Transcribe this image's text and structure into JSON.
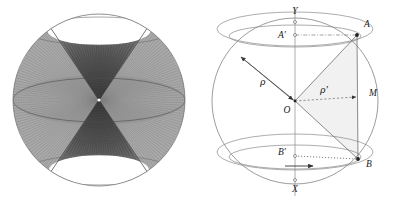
{
  "figure": {
    "panels": [
      {
        "id": "left-panel",
        "name": "sphere-double-cone-mesh",
        "description": "Shaded sphere with dense wireframe mesh forming two opposed cones meeting at the center",
        "geometry": {
          "sphere_center_x": 99,
          "sphere_center_y": 100,
          "sphere_radius": 86,
          "apex_x": 99,
          "apex_y": 100,
          "cone_half_angle_deg": 28,
          "equator_ry": 22,
          "top_cap_ry": 14,
          "bottom_cap_ry": 16
        },
        "colors": {
          "outline": "#7a7a7a",
          "mesh_dark": "#3a3a3a",
          "mesh_mid": "#8e8e8e",
          "mesh_light": "#bdbdbd",
          "cap_fill": "#ffffff"
        }
      },
      {
        "id": "right-panel",
        "name": "sphere-cross-section-rho-diagram",
        "description": "Great circle of a sphere with axis Y-X, points A, B on the surface, projections A-prime, B-prime, midpoint M, radius rho and sub-radius rho-prime",
        "geometry": {
          "circle_center_x": 96,
          "circle_center_y": 101,
          "circle_radius": 83,
          "axis_top_y": 8,
          "axis_bottom_y": 196,
          "point_O": [
            96,
            101
          ],
          "point_A": [
            158,
            35
          ],
          "point_B": [
            159,
            159
          ],
          "point_M": [
            157,
            97
          ],
          "point_A_prime": [
            96,
            35
          ],
          "point_B_prime": [
            96,
            156
          ],
          "point_Y": [
            96,
            22
          ],
          "point_X": [
            96,
            180
          ],
          "upper_ellipse_outer": {
            "cx": 96,
            "cy": 29,
            "rx": 78,
            "ry": 17
          },
          "upper_ellipse_inner": {
            "cx": 96,
            "cy": 36,
            "rx": 66,
            "ry": 11
          },
          "lower_ellipse_outer": {
            "cx": 96,
            "cy": 152,
            "rx": 78,
            "ry": 18
          },
          "lower_ellipse_inner": {
            "cx": 96,
            "cy": 157,
            "rx": 66,
            "ry": 12
          },
          "rho_arrow_end": [
            42,
            57
          ]
        },
        "colors": {
          "outline": "#8a8a8a",
          "construction": "#777777",
          "dashed": "#9a9a9a",
          "shade_fill": "#f0f0f0",
          "label": "#1a1a1a",
          "point": "#222222"
        },
        "labels": [
          {
            "key": "Y",
            "text": "Y",
            "x": 96,
            "y": 14,
            "anchor": "middle",
            "italic": true,
            "size": 9.5
          },
          {
            "key": "X",
            "text": "X",
            "x": 96,
            "y": 192,
            "anchor": "middle",
            "italic": true,
            "size": 9.5
          },
          {
            "key": "O",
            "text": "O",
            "x": 88,
            "y": 113,
            "anchor": "middle",
            "italic": true,
            "size": 9.5
          },
          {
            "key": "A",
            "text": "A",
            "x": 168,
            "y": 27,
            "anchor": "middle",
            "italic": true,
            "size": 9.5
          },
          {
            "key": "B",
            "text": "B",
            "x": 170,
            "y": 167,
            "anchor": "middle",
            "italic": true,
            "size": 9.5
          },
          {
            "key": "M",
            "text": "M",
            "x": 174,
            "y": 96,
            "anchor": "middle",
            "italic": true,
            "size": 9.5
          },
          {
            "key": "Aprime",
            "text": "A′",
            "x": 83,
            "y": 38,
            "anchor": "middle",
            "italic": true,
            "size": 9.5
          },
          {
            "key": "Bprime",
            "text": "B′",
            "x": 83,
            "y": 155,
            "anchor": "middle",
            "italic": true,
            "size": 9.5
          },
          {
            "key": "rho",
            "text": "ρ",
            "x": 64,
            "y": 85,
            "anchor": "middle",
            "italic": true,
            "size": 11
          },
          {
            "key": "rhoprime",
            "text": "ρ′",
            "x": 125,
            "y": 93,
            "anchor": "middle",
            "italic": true,
            "size": 11
          }
        ]
      }
    ]
  },
  "chart_data": {
    "type": "diagram",
    "title": "",
    "figures": [
      {
        "name": "sphere-double-cone-mesh",
        "elements": [
          "sphere-outline",
          "upper-cone",
          "lower-cone",
          "equator-ellipse",
          "top-cap-ellipse",
          "bottom-cap-ellipse",
          "mesh-lines"
        ],
        "annotations": []
      },
      {
        "name": "sphere-cross-section-rho-diagram",
        "points": {
          "O": "center of sphere",
          "A": "point on sphere upper right",
          "B": "point on sphere lower right",
          "M": "midpoint of chord AB",
          "A'": "projection of A on axis",
          "B'": "projection of B on axis",
          "X": "lower axis pole",
          "Y": "upper axis pole"
        },
        "segments": [
          {
            "from": "O",
            "to": "A",
            "style": "solid"
          },
          {
            "from": "O",
            "to": "B",
            "style": "solid"
          },
          {
            "from": "A",
            "to": "B",
            "style": "solid"
          },
          {
            "from": "O",
            "to": "M",
            "style": "dashed",
            "label": "ρ′"
          },
          {
            "from": "O",
            "to": "rho_arrow_end",
            "style": "solid",
            "label": "ρ"
          },
          {
            "from": "A'",
            "to": "A",
            "style": "dash-dot"
          },
          {
            "from": "B'",
            "to": "B",
            "style": "dotted"
          }
        ],
        "annotations": [
          "ρ",
          "ρ′",
          "X",
          "Y",
          "O",
          "A",
          "B",
          "M",
          "A′",
          "B′"
        ]
      }
    ]
  }
}
